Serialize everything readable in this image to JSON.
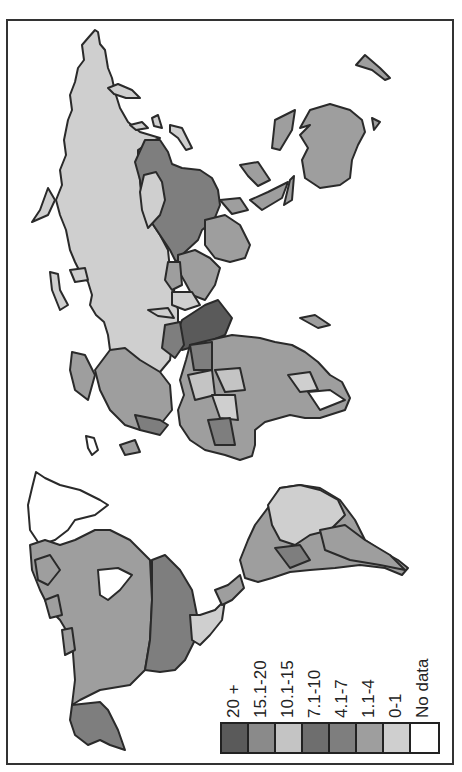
{
  "map": {
    "orientation": "rotated 90° counter-clockwise world map",
    "regions": [
      {
        "name": "Russia",
        "class": "0-1"
      },
      {
        "name": "China",
        "class": "4.1-7"
      },
      {
        "name": "Mongolia",
        "class": "0-1"
      },
      {
        "name": "India",
        "class": "1.1-4"
      },
      {
        "name": "Australia",
        "class": "1.1-4"
      },
      {
        "name": "Africa",
        "class": "mixed"
      },
      {
        "name": "Europe",
        "class": "mixed"
      },
      {
        "name": "Canada",
        "class": "1.1-4"
      },
      {
        "name": "United States",
        "class": "4.1-7"
      },
      {
        "name": "Alaska",
        "class": "4.1-7"
      },
      {
        "name": "Greenland",
        "class": "No data"
      },
      {
        "name": "Mexico",
        "class": "0-1"
      },
      {
        "name": "Brazil",
        "class": "0-1"
      },
      {
        "name": "Argentina/Chile",
        "class": "1.1-4"
      },
      {
        "name": "Saudi Arabia",
        "class": "20 +"
      }
    ]
  },
  "legend": {
    "items": [
      {
        "label": "20 +",
        "color": "#5a5a5a"
      },
      {
        "label": "15.1-20",
        "color": "#8a8a8a"
      },
      {
        "label": "10.1-15",
        "color": "#c4c4c4"
      },
      {
        "label": "7.1-10",
        "color": "#6e6e6e"
      },
      {
        "label": "4.1-7",
        "color": "#7e7e7e"
      },
      {
        "label": "1.1-4",
        "color": "#9e9e9e"
      },
      {
        "label": "0-1",
        "color": "#cfcfcf"
      },
      {
        "label": "No data",
        "color": "#ffffff"
      }
    ]
  }
}
